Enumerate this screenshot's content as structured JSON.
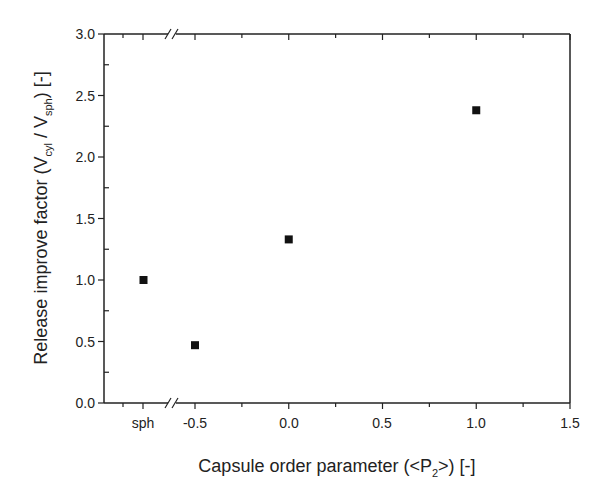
{
  "chart_data": {
    "type": "scatter",
    "title": "",
    "xlabel": "Capsule order parameter (<P2>) [-]",
    "xlabel_parts": [
      "Capsule order parameter (<P",
      "2",
      ">) [-]"
    ],
    "ylabel": "Release improve factor (Vcyl / Vsph) [-]",
    "ylabel_parts": [
      "Release improve factor (V",
      "cyl",
      " / V",
      "sph",
      ") [-]"
    ],
    "xlim": [
      -0.5,
      1.5
    ],
    "ylim": [
      0.0,
      3.0
    ],
    "x_axis_break": true,
    "x_ticks": [
      {
        "label": "sph",
        "pos": 143
      },
      {
        "label": "-0.5",
        "pos": 195
      },
      {
        "label": "0.0",
        "pos": 289
      },
      {
        "label": "0.5",
        "pos": 382
      },
      {
        "label": "1.0",
        "pos": 476
      },
      {
        "label": "1.5",
        "pos": 570
      }
    ],
    "y_ticks": [
      "0.0",
      "0.5",
      "1.0",
      "1.5",
      "2.0",
      "2.5",
      "3.0"
    ],
    "grid": false,
    "legend": null,
    "marker": "square",
    "marker_color": "#111111",
    "points": [
      {
        "x": "sph",
        "y": 1.0
      },
      {
        "x": -0.5,
        "y": 0.47
      },
      {
        "x": 0.0,
        "y": 1.33
      },
      {
        "x": 1.0,
        "y": 2.38
      }
    ]
  }
}
